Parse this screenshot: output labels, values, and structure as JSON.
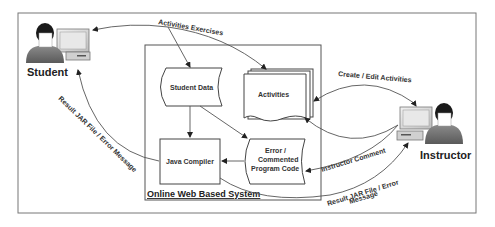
{
  "diagram": {
    "actors": {
      "student": {
        "label": "Student"
      },
      "instructor": {
        "label": "Instructor"
      }
    },
    "system": {
      "label": "Online Web Based System"
    },
    "nodes": {
      "student_data": {
        "label": "Student Data"
      },
      "activities": {
        "label": "Activities"
      },
      "java_compiler": {
        "label": "Java Compiler"
      },
      "error_code": {
        "line1": "Error /",
        "line2": "Commented",
        "line3": "Program Code"
      }
    },
    "edges": {
      "activities_exercises": {
        "label": "Activities Exercises"
      },
      "create_edit": {
        "label": "Create / Edit Activities"
      },
      "instructor_comment": {
        "label": "Instructor Comment"
      },
      "result_student": {
        "label": "Result JAR File / Error Message"
      },
      "result_instructor": {
        "line1": "Result JAR File / Error",
        "line2": "Message"
      }
    },
    "colors": {
      "line": "#555555",
      "person_body": "#6e6e6e",
      "monitor": "#d8d8d8",
      "background": "#ffffff"
    }
  }
}
